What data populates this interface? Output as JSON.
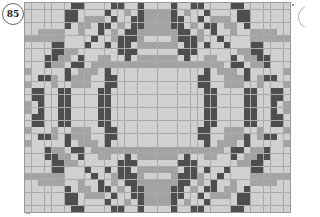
{
  "page": {
    "number": "85",
    "chart_pattern": {
      "columns": 40,
      "rows": 32,
      "symmetry": "mirror-both-axes",
      "colors": {
        "light": "#d0d0d0",
        "medium": "#a3a3a3",
        "dark": "#4e4e4e",
        "gridline": "#a9a9a9"
      },
      "quadrant_top_left": [
        {
          "d": [
            7,
            8,
            13,
            14,
            17
          ],
          "m": []
        },
        {
          "d": [
            6,
            7,
            12,
            17
          ],
          "m": [
            15,
            18,
            19
          ]
        },
        {
          "d": [
            6,
            7,
            13,
            16,
            17
          ],
          "m": [
            9,
            10,
            11,
            18,
            19
          ]
        },
        {
          "d": [
            6,
            11,
            12,
            16,
            17
          ],
          "m": [
            8,
            9,
            14,
            18,
            19
          ]
        },
        {
          "d": [
            11,
            15,
            16
          ],
          "m": [
            2,
            3,
            4,
            5,
            8,
            13,
            17,
            18,
            19
          ]
        },
        {
          "d": [
            10,
            14,
            15,
            16
          ],
          "m": [
            0,
            1,
            2,
            3,
            4,
            5,
            13,
            17
          ]
        },
        {
          "d": [
            4,
            5,
            9,
            12,
            14,
            15
          ],
          "m": [
            17,
            18,
            19
          ]
        },
        {
          "d": [
            4,
            5,
            14,
            15,
            16
          ],
          "m": [
            6,
            7
          ]
        },
        {
          "d": [
            3,
            4,
            8,
            15
          ],
          "m": [
            5,
            6,
            11,
            12,
            17,
            18,
            19
          ]
        },
        {
          "d": [
            3,
            7,
            8
          ],
          "m": [
            4,
            5,
            10,
            11,
            12,
            13,
            14,
            15,
            16,
            17,
            18,
            19
          ]
        },
        {
          "d": [
            6,
            12
          ],
          "m": [
            0,
            8,
            9,
            10
          ]
        },
        {
          "d": [
            2,
            3,
            6,
            12,
            13
          ],
          "m": [
            4,
            7,
            8,
            9
          ]
        },
        {
          "d": [
            12,
            13
          ],
          "m": [
            0,
            4,
            7,
            8,
            9
          ]
        },
        {
          "d": [
            1,
            2,
            5,
            6,
            11,
            12
          ],
          "m": []
        },
        {
          "d": [
            1,
            2,
            5,
            6,
            11,
            12
          ],
          "m": []
        },
        {
          "d": [
            2,
            5,
            6,
            11,
            12
          ],
          "m": [
            0
          ]
        }
      ]
    }
  }
}
